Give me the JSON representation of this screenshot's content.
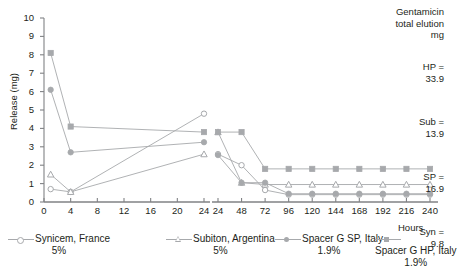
{
  "chart_data": {
    "type": "line",
    "title": "",
    "xlabel": "Hours",
    "ylabel": "Release (mg)",
    "ylim": [
      0,
      10
    ],
    "yticks": [
      0,
      1,
      2,
      3,
      4,
      5,
      6,
      7,
      8,
      9,
      10
    ],
    "grid": false,
    "legend_position": "bottom",
    "panels": [
      {
        "name": "left-panel",
        "xlim": [
          0,
          24
        ],
        "xticks": [
          0,
          4,
          8,
          12,
          16,
          20,
          24
        ]
      },
      {
        "name": "right-panel",
        "xlim": [
          24,
          240
        ],
        "xticks": [
          24,
          48,
          72,
          96,
          120,
          144,
          168,
          192,
          216,
          240
        ]
      }
    ],
    "series": [
      {
        "name": "Synicem, France",
        "short": "Syn",
        "concentration": "5%",
        "marker": "open-circle",
        "color": "#a7a9ac",
        "x": [
          1,
          4,
          24,
          24,
          48,
          72,
          96,
          120,
          144,
          168,
          192,
          216,
          240
        ],
        "y": [
          0.7,
          0.55,
          4.8,
          2.6,
          2.0,
          0.65,
          0.4,
          0.4,
          0.4,
          0.4,
          0.4,
          0.4,
          0.4
        ]
      },
      {
        "name": "Subiton, Argentina",
        "short": "Sub",
        "concentration": "5%",
        "marker": "open-triangle",
        "color": "#a7a9ac",
        "x": [
          1,
          4,
          24,
          24,
          48,
          72,
          96,
          120,
          144,
          168,
          192,
          216,
          240
        ],
        "y": [
          1.5,
          0.55,
          2.6,
          3.8,
          1.05,
          0.95,
          0.95,
          0.95,
          0.95,
          0.95,
          0.95,
          0.95,
          0.95
        ]
      },
      {
        "name": "Spacer G SP, Italy",
        "short": "SP",
        "concentration": "1.9%",
        "marker": "filled-circle",
        "color": "#a7a9ac",
        "x": [
          1,
          4,
          24,
          24,
          48,
          72,
          96,
          120,
          144,
          168,
          192,
          216,
          240
        ],
        "y": [
          6.1,
          2.7,
          3.25,
          2.55,
          1.05,
          1.05,
          0.45,
          0.45,
          0.45,
          0.45,
          0.45,
          0.45,
          0.45
        ]
      },
      {
        "name": "Spacer G HP, Italy",
        "short": "HP",
        "concentration": "1.9%",
        "marker": "filled-square",
        "color": "#a7a9ac",
        "x": [
          1,
          4,
          24,
          24,
          48,
          72,
          96,
          120,
          144,
          168,
          192,
          216,
          240
        ],
        "y": [
          8.1,
          4.1,
          3.8,
          3.8,
          3.8,
          1.8,
          1.8,
          1.8,
          1.8,
          1.8,
          1.8,
          1.8,
          1.8
        ]
      }
    ]
  },
  "info": {
    "heading_line1": "Gentamicin",
    "heading_line2": "total elution",
    "heading_line3": "mg",
    "rows": [
      {
        "label": "HP =",
        "value": "33.9"
      },
      {
        "label": "Sub =",
        "value": "13.9"
      },
      {
        "label": "SP =",
        "value": "16.9"
      },
      {
        "label": "Syn =",
        "value": "9.8"
      }
    ]
  },
  "legend": {
    "items": [
      {
        "label": "Synicem, France",
        "pct": "5%",
        "marker": "open-circle"
      },
      {
        "label": "Subiton, Argentina",
        "pct": "5%",
        "marker": "open-triangle"
      },
      {
        "label": "Spacer G SP, Italy",
        "pct": "1.9%",
        "marker": "filled-circle"
      },
      {
        "label": "Spacer G HP, Italy",
        "pct": "1.9%",
        "marker": "filled-square"
      }
    ]
  },
  "axes": {
    "y_title": "Release (mg)",
    "x_title": "Hours",
    "y_ticks": [
      "0",
      "1",
      "2",
      "3",
      "4",
      "5",
      "6",
      "7",
      "8",
      "9",
      "10"
    ],
    "x_ticks_left": [
      "0",
      "4",
      "8",
      "12",
      "16",
      "20",
      "24"
    ],
    "x_ticks_right": [
      "24",
      "48",
      "72",
      "96",
      "120",
      "144",
      "168",
      "192",
      "216",
      "240"
    ]
  },
  "colors": {
    "series": "#a7a9ac",
    "axis": "#808285",
    "text": "#231f20"
  }
}
